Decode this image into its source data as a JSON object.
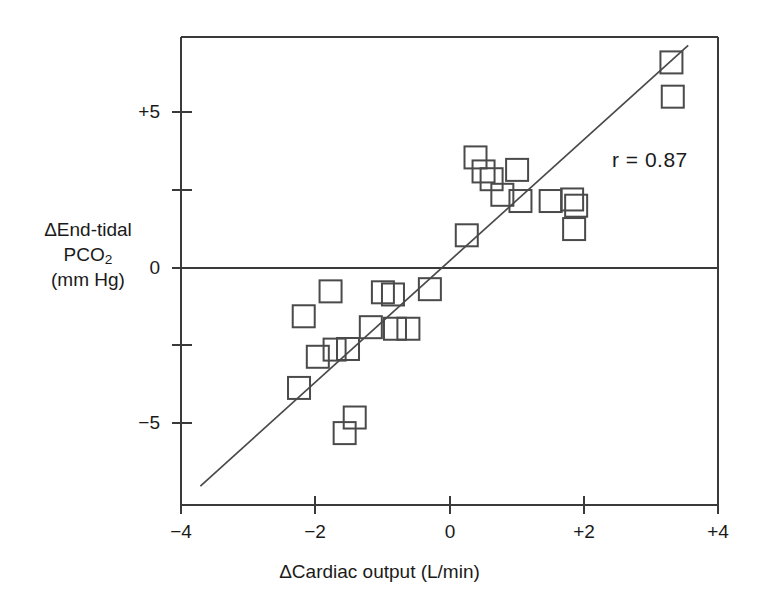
{
  "chart_data": {
    "type": "scatter",
    "title": "",
    "xlabel": "ΔCardiac output (L/min)",
    "ylabel_lines": [
      "ΔEnd-tidal",
      "PCO2",
      "(mm Hg)"
    ],
    "ylabel": "ΔEnd-tidal PCO2 (mm Hg)",
    "xlim": [
      -4,
      4
    ],
    "ylim": [
      -7.5,
      7.5
    ],
    "xticks": [
      -4,
      -2,
      0,
      2,
      4
    ],
    "xticklabels": [
      "−4",
      "−2",
      "0",
      "+2",
      "+4"
    ],
    "yticks": [
      5,
      2.5,
      0,
      -2.5,
      -5
    ],
    "yticklabels": [
      "+5",
      "",
      "0",
      "",
      "−5"
    ],
    "grid": false,
    "legend": null,
    "marker": "open-square",
    "annotations": [
      {
        "text": "r = 0.87",
        "x": 2.45,
        "y": 3.0
      }
    ],
    "zero_line_y": 0,
    "fit_line": {
      "label": "regression-line",
      "x_start": -3.72,
      "y_start": -7.0,
      "x_end": 3.55,
      "y_end": 7.15,
      "slope": 1.945,
      "intercept": 0.235
    },
    "points": [
      {
        "x": -2.18,
        "y": -1.55
      },
      {
        "x": -2.25,
        "y": -3.85
      },
      {
        "x": -1.97,
        "y": -2.85
      },
      {
        "x": -1.78,
        "y": -0.75
      },
      {
        "x": -1.72,
        "y": -2.62
      },
      {
        "x": -1.52,
        "y": -2.6
      },
      {
        "x": -1.42,
        "y": -4.8
      },
      {
        "x": -1.57,
        "y": -5.3
      },
      {
        "x": -1.18,
        "y": -1.9
      },
      {
        "x": -1.0,
        "y": -0.78
      },
      {
        "x": -0.85,
        "y": -0.85
      },
      {
        "x": -0.82,
        "y": -1.95
      },
      {
        "x": -0.62,
        "y": -1.95
      },
      {
        "x": -0.3,
        "y": -0.68
      },
      {
        "x": 0.25,
        "y": 1.05
      },
      {
        "x": 0.38,
        "y": 3.55
      },
      {
        "x": 0.5,
        "y": 3.1
      },
      {
        "x": 0.62,
        "y": 2.85
      },
      {
        "x": 0.78,
        "y": 2.35
      },
      {
        "x": 1.0,
        "y": 3.15
      },
      {
        "x": 1.05,
        "y": 2.15
      },
      {
        "x": 1.5,
        "y": 2.15
      },
      {
        "x": 1.82,
        "y": 2.2
      },
      {
        "x": 1.88,
        "y": 2.0
      },
      {
        "x": 1.85,
        "y": 1.25
      },
      {
        "x": 3.3,
        "y": 6.6
      },
      {
        "x": 3.32,
        "y": 5.5
      }
    ]
  },
  "axes": {
    "x_tick_labels": [
      {
        "value": -4,
        "text": "−4"
      },
      {
        "value": -2,
        "text": "−2"
      },
      {
        "value": 0,
        "text": "0"
      },
      {
        "value": 2,
        "text": "+2"
      },
      {
        "value": 4,
        "text": "+4"
      }
    ],
    "y_tick_labels": [
      {
        "value": 5,
        "text": "+5"
      },
      {
        "value": 0,
        "text": "0"
      },
      {
        "value": -5,
        "text": "−5"
      }
    ]
  },
  "annotation": {
    "correlation": "r = 0.87"
  },
  "labels": {
    "x_axis_title": "ΔCardiac output (L/min)",
    "y_axis_line1": "ΔEnd-tidal",
    "y_axis_line2_base": "PCO",
    "y_axis_line2_sub": "2",
    "y_axis_line3": "(mm Hg)"
  },
  "colors": {
    "background": "#ffffff",
    "axis": "#3a3a3a",
    "marker_stroke": "#4a4a4a",
    "text": "#1a1a1a",
    "fit_line": "#4a4a4a"
  }
}
